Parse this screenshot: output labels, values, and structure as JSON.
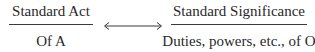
{
  "diagram": {
    "left": {
      "numerator": "Standard Act",
      "denominator": "Of A"
    },
    "connector": {
      "type": "double-headed-arrow"
    },
    "right": {
      "numerator": "Standard Significance",
      "denominator": "Duties, powers, etc., of O"
    }
  }
}
